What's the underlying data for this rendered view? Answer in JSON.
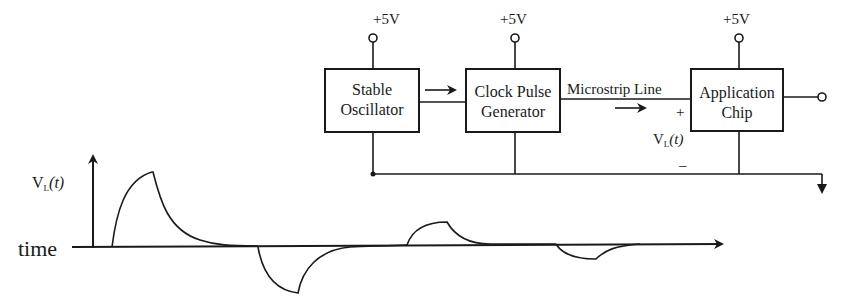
{
  "circuit": {
    "supply_label": "+5V",
    "blocks": [
      {
        "line1": "Stable",
        "line2": "Oscillator"
      },
      {
        "line1": "Clock Pulse",
        "line2": "Generator"
      },
      {
        "line1": "Application",
        "line2": "Chip"
      }
    ],
    "line_label": "Microstrip Line",
    "plus_sign": "+",
    "minus_sign": "–",
    "voltage_label": "V",
    "voltage_sub": "L",
    "voltage_arg": "(t)"
  },
  "waveform": {
    "y_label": "V",
    "y_sub": "L",
    "y_arg": "(t)",
    "x_label": "time",
    "pulses": [
      {
        "polarity": "positive",
        "relative_amplitude": 1.0
      },
      {
        "polarity": "negative",
        "relative_amplitude": 0.58
      },
      {
        "polarity": "positive",
        "relative_amplitude": 0.29
      },
      {
        "polarity": "negative",
        "relative_amplitude": 0.18
      }
    ]
  }
}
